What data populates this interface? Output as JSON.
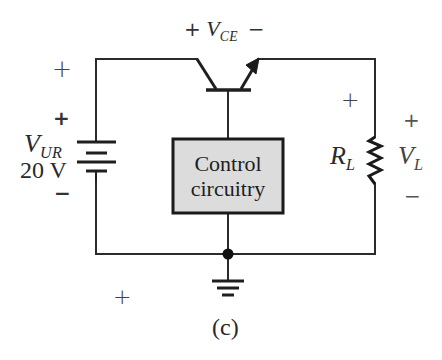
{
  "figure": {
    "caption": "(c)",
    "colors": {
      "wire": "#2b2b2b",
      "box_fill": "#dcdcdc",
      "box_border": "#1a1a1a",
      "text": "#2a2a2a"
    }
  },
  "source": {
    "symbol_main": "V",
    "symbol_sub": "UR",
    "value": "20 V",
    "plus_sign": "+",
    "minus_sign": "−",
    "outer_plus_sign": "+"
  },
  "transistor": {
    "label_plus": "+",
    "symbol_main": "V",
    "symbol_sub": "CE",
    "label_minus": "−"
  },
  "control_block": {
    "line1": "Control",
    "line2": "circuitry"
  },
  "load": {
    "resistor_main": "R",
    "resistor_sub": "L",
    "voltage_main": "V",
    "voltage_sub": "L",
    "plus_sign": "+",
    "minus_sign": "−",
    "inner_plus_sign": "+"
  },
  "stray_marks": {
    "bottom_left_plus": "+"
  }
}
